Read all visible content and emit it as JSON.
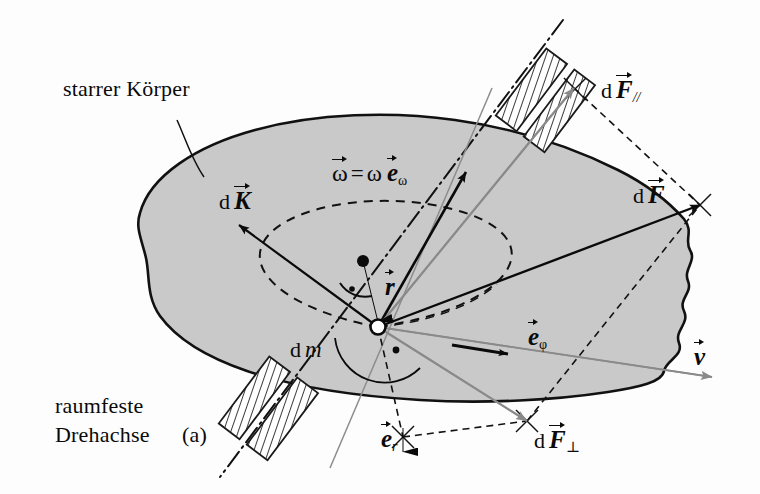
{
  "figure": {
    "background_color": "#fdfdfd",
    "body_fill_color": "#c9c9c9",
    "body_stroke_color": "#111111",
    "gray_vector_color": "#8a8a8a",
    "black_vector_color": "#0a0a0a"
  },
  "labels": {
    "rigid_body": "starrer Körper",
    "axis_line1": "raumfeste",
    "axis_line2": "Drehachse",
    "axis_marker": "(a)",
    "omega_equation_d": "",
    "omega_lhs": "ω",
    "omega_eq": "=",
    "omega_scalar": "ω",
    "omega_unit": "e",
    "omega_unit_sub": "ω",
    "dK_d": "d",
    "dK_sym": "K",
    "dF_d": "d",
    "dF_sym": "F",
    "dFpar_d": "d",
    "dFpar_sym": "F",
    "dFpar_sub": "//",
    "dFperp_d": "d",
    "dFperp_sym": "F",
    "dFperp_sub": "⊥",
    "dm_d": "d",
    "dm_sym": "m",
    "r_sym": "r",
    "v_sym": "v",
    "e_phi_sym": "e",
    "e_phi_sub": "φ",
    "e_r_sym": "e",
    "e_r_sub": "r"
  },
  "geometry": {
    "rotation_axis": {
      "x1": 563,
      "y1": 20,
      "x2": 220,
      "y2": 477,
      "style": "dash-dot"
    },
    "mass_element_point": {
      "x": 378,
      "y": 327
    },
    "omega_origin": {
      "x": 378,
      "y": 327
    },
    "omega_tip": {
      "x": 466,
      "y": 172
    },
    "r_origin": {
      "x": 363,
      "y": 261
    },
    "r_tip": {
      "x": 378,
      "y": 327
    },
    "dF_tip": {
      "x": 700,
      "y": 205
    },
    "dFpar_tip": {
      "x": 574,
      "y": 88
    },
    "dFperp_tip": {
      "x": 527,
      "y": 421
    },
    "dK_tip": {
      "x": 239,
      "y": 225
    },
    "v_tip": {
      "x": 712,
      "y": 377
    },
    "e_phi_tip": {
      "x": 508,
      "y": 354
    },
    "e_r_tip": {
      "x": 403,
      "y": 452
    },
    "bearing_upper": {
      "x": 545,
      "y": 100
    },
    "bearing_lower": {
      "x": 268,
      "y": 408
    }
  }
}
